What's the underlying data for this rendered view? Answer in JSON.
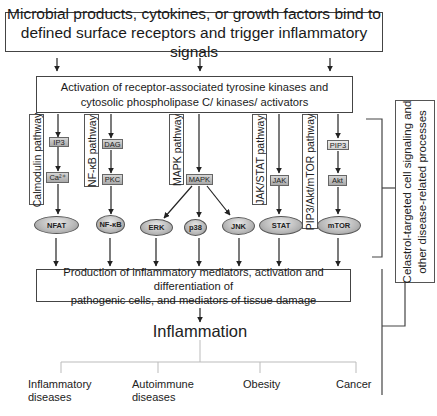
{
  "top_box": {
    "line1": "Microbial products, cytokines, or growth factors bind to",
    "line2": "defined surface receptors and trigger inflammatory signals"
  },
  "activation_box": {
    "line1": "Activation of receptor-associated tyrosine kinases and",
    "line2": "cytosolic phospholipase C/ kinases/ activators"
  },
  "pathways": [
    {
      "label": "Calmodulin pathway",
      "nodes": [
        "IP3",
        "Ca²⁺"
      ],
      "effector": "NFAT"
    },
    {
      "label": "NF-κB pathway",
      "nodes": [
        "DAG",
        "PKC"
      ],
      "effector": "NF-κB"
    },
    {
      "label": "MAPK pathway",
      "nodes": [
        "MAPK"
      ],
      "effectors": [
        "ERK",
        "p38",
        "JNK"
      ]
    },
    {
      "label": "JAK/STAT pathway",
      "nodes": [
        "JAK"
      ],
      "effector": "STAT"
    },
    {
      "label": "PIP3/Akt/mTOR pathway",
      "nodes": [
        "PIP3",
        "Akt"
      ],
      "effector": "mTOR"
    }
  ],
  "production_box": {
    "line1": "Production of inflammatory mediators, activation and differentiation of",
    "line2": "pathogenic cells, and mediators of tissue damage"
  },
  "outcome": "Inflammation",
  "diseases": [
    {
      "line1": "Inflammatory",
      "line2": "diseases"
    },
    {
      "line1": "Autoimmune",
      "line2": "diseases"
    },
    {
      "line1": "Obesity",
      "line2": ""
    },
    {
      "line1": "Cancer",
      "line2": ""
    }
  ],
  "side_label": {
    "line1": "Celastrol-targeted cell signaling and",
    "line2": "other disease-related processes"
  }
}
